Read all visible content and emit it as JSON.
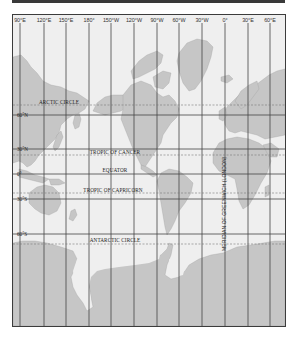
{
  "map": {
    "title": "World map (Mercator projection) with latitude and longitude grid",
    "colors": {
      "ocean": "#efefef",
      "land": "#c6c6c6",
      "grid": "#444444",
      "frame": "#3c3c3c",
      "top_bar": "#3a3a3a"
    },
    "longitudes": [
      {
        "label": "90°E",
        "x": 7
      },
      {
        "label": "120°E",
        "x": 31
      },
      {
        "label": "150°E",
        "x": 53
      },
      {
        "label": "180°",
        "x": 76
      },
      {
        "label": "150°W",
        "x": 98
      },
      {
        "label": "120°W",
        "x": 121
      },
      {
        "label": "90°W",
        "x": 144
      },
      {
        "label": "60°W",
        "x": 166
      },
      {
        "label": "30°W",
        "x": 189
      },
      {
        "label": "0°",
        "x": 212
      },
      {
        "label": "30°E",
        "x": 235
      },
      {
        "label": "60°E",
        "x": 257
      }
    ],
    "latitudes": [
      {
        "label": "60°N",
        "y": 100
      },
      {
        "label": "30°N",
        "y": 134
      },
      {
        "label": "0°",
        "y": 159
      },
      {
        "label": "30°S",
        "y": 184
      },
      {
        "label": "60°S",
        "y": 219
      }
    ],
    "special_lines": [
      {
        "label": "ARCTIC CIRCLE",
        "y": 90,
        "label_x": 35
      },
      {
        "label": "TROPIC OF CANCER",
        "y": 140,
        "label_x": 82
      },
      {
        "label": "EQUATOR",
        "y": 159,
        "label_x": 85
      },
      {
        "label": "TROPIC OF CAPRICORN",
        "y": 178,
        "label_x": 80
      },
      {
        "label": "ANTARCTIC CIRCLE",
        "y": 229,
        "label_x": 85
      }
    ],
    "meridian_label": "MERIDIAN OF GREENWICH (LONDON)"
  }
}
